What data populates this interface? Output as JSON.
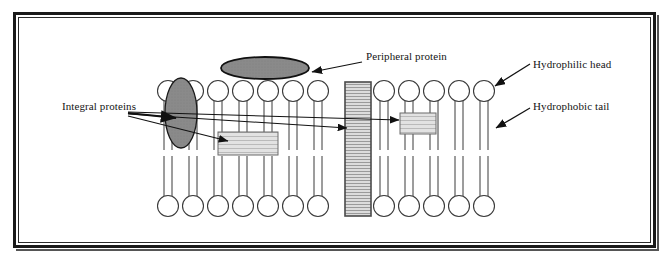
{
  "diagram": {
    "labels": {
      "peripheral_protein": "Peripheral protein",
      "hydrophilic_head": "Hydrophilic head",
      "hydrophobic_tail": "Hydrophobic tail",
      "integral_proteins": "Integral proteins"
    },
    "colors": {
      "frame": "#1a1a1a",
      "background": "#ffffff",
      "head_fill": "#ffffff",
      "head_stroke": "#3a3a3a",
      "tail_stroke": "#3a3a3a",
      "dark_protein_fill": "#7a7a7a",
      "dark_protein_stroke": "#1a1a1a",
      "peripheral_fill": "#8a8a8a",
      "peripheral_stroke": "#111111",
      "channel_fill": "#cfcfcf",
      "channel_stroke": "#4a4a4a",
      "integral_rect_fill": "#d9d9d9",
      "integral_rect_stroke": "#6b6b6b",
      "leader_line": "#111111",
      "text": "#141414"
    },
    "structure": {
      "bilayer_head_count_top": 13,
      "bilayer_head_count_bottom": 12,
      "head_diameter": 21,
      "head_spacing": 25,
      "tails_per_phospholipid": 2,
      "bilayer_left": 158,
      "bilayer_right": 500,
      "top_head_center_y": 91,
      "bottom_head_center_y": 206
    },
    "components": [
      {
        "name": "peripheral-protein-ellipse",
        "shape": "ellipse",
        "cx": 265,
        "cy": 68,
        "rx": 44,
        "ry": 11
      },
      {
        "name": "integral-protein-dark-ellipse",
        "shape": "ellipse",
        "cx": 181,
        "cy": 113,
        "rx": 16,
        "ry": 35
      },
      {
        "name": "integral-protein-wide-rect",
        "shape": "rect",
        "x": 218,
        "y": 132,
        "w": 60,
        "h": 23
      },
      {
        "name": "integral-protein-channel",
        "shape": "rect",
        "x": 345,
        "y": 82,
        "w": 26,
        "h": 134
      },
      {
        "name": "integral-protein-small-rect",
        "shape": "rect",
        "x": 400,
        "y": 113,
        "w": 36,
        "h": 21
      }
    ]
  }
}
